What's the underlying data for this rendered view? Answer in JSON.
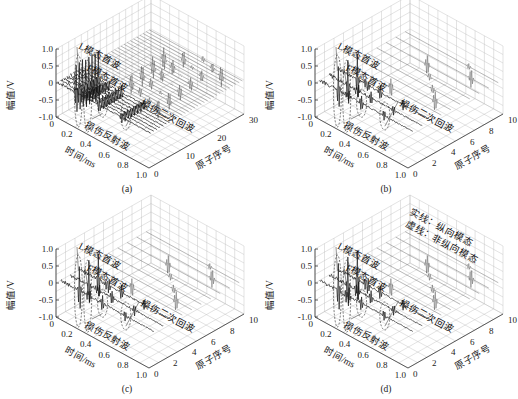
{
  "figure": {
    "panels": [
      {
        "id": "a",
        "caption": "(a)",
        "n_elements": 30,
        "element_ticks": [
          "0",
          "10",
          "20",
          "30"
        ],
        "annotations": [
          "L模态首波",
          "F模态首波",
          "损伤反射波",
          "损伤二次回波"
        ],
        "legend": []
      },
      {
        "id": "b",
        "caption": "(b)",
        "n_elements": 10,
        "element_ticks": [
          "0",
          "2",
          "4",
          "6",
          "8",
          "10"
        ],
        "annotations": [
          "L模态首波",
          "F模态首波",
          "损伤反射波",
          "损伤二次回波"
        ],
        "legend": []
      },
      {
        "id": "c",
        "caption": "(c)",
        "n_elements": 10,
        "element_ticks": [
          "0",
          "2",
          "4",
          "6",
          "8",
          "10"
        ],
        "annotations": [
          "L模态首波",
          "F模态首波",
          "损伤反射波",
          "损伤二次回波"
        ],
        "legend": []
      },
      {
        "id": "d",
        "caption": "(d)",
        "n_elements": 10,
        "element_ticks": [
          "0",
          "2",
          "4",
          "6",
          "8",
          "10"
        ],
        "annotations": [
          "L模态首波",
          "F模态首波",
          "损伤反射波",
          "损伤二次回波"
        ],
        "legend": [
          "实线：纵向模态",
          "虚线：非纵向模态"
        ]
      }
    ]
  },
  "chart_data": [
    {
      "type": "line",
      "subtype": "3d-waterfall",
      "title": "(a)",
      "xlabel": "时间/ms",
      "ylabel": "原子序号",
      "zlabel": "幅值/V",
      "x_ticks": [
        "0",
        "0.2",
        "0.4",
        "0.6",
        "0.8",
        "1.0"
      ],
      "y_ticks": [
        "0",
        "10",
        "20",
        "30"
      ],
      "z_ticks": [
        "-1.0",
        "-0.5",
        "0",
        "0.5",
        "1.0"
      ],
      "xlim": [
        0,
        1.0
      ],
      "ylim": [
        0,
        30
      ],
      "zlim": [
        -1.0,
        1.0
      ],
      "grid": true,
      "annotations": [
        "L模态首波",
        "F模态首波",
        "损伤反射波",
        "损伤二次回波"
      ],
      "series_peaks": [
        {
          "name": "L模态首波",
          "time_ms": 0.2,
          "amplitude": 0.9
        },
        {
          "name": "F模态首波",
          "time_ms": 0.3,
          "amplitude": 0.5
        },
        {
          "name": "损伤反射波",
          "time_ms": 0.45,
          "amplitude": 0.3
        },
        {
          "name": "损伤二次回波",
          "time_ms": 0.7,
          "amplitude": 0.3
        }
      ]
    },
    {
      "type": "line",
      "subtype": "3d-waterfall",
      "title": "(b)",
      "xlabel": "时间/ms",
      "ylabel": "原子序号",
      "zlabel": "幅值/V",
      "x_ticks": [
        "0",
        "0.2",
        "0.4",
        "0.6",
        "0.8",
        "1.0"
      ],
      "y_ticks": [
        "0",
        "2",
        "4",
        "6",
        "8",
        "10"
      ],
      "z_ticks": [
        "-1.0",
        "-0.5",
        "0",
        "0.5",
        "1.0"
      ],
      "xlim": [
        0,
        1.0
      ],
      "ylim": [
        0,
        10
      ],
      "zlim": [
        -1.0,
        1.0
      ],
      "grid": true,
      "annotations": [
        "L模态首波",
        "F模态首波",
        "损伤反射波",
        "损伤二次回波"
      ],
      "series_peaks": [
        {
          "name": "L模态首波",
          "time_ms": 0.2,
          "amplitude": 0.8
        },
        {
          "name": "F模态首波",
          "time_ms": 0.3,
          "amplitude": 0.5
        },
        {
          "name": "损伤反射波",
          "time_ms": 0.45,
          "amplitude": 0.3
        },
        {
          "name": "损伤二次回波",
          "time_ms": 0.7,
          "amplitude": 0.3
        }
      ]
    },
    {
      "type": "line",
      "subtype": "3d-waterfall",
      "title": "(c)",
      "xlabel": "时间/ms",
      "ylabel": "原子序号",
      "zlabel": "幅值/V",
      "x_ticks": [
        "0",
        "0.2",
        "0.4",
        "0.6",
        "0.8",
        "1.0"
      ],
      "y_ticks": [
        "0",
        "2",
        "4",
        "6",
        "8",
        "10"
      ],
      "z_ticks": [
        "-1.0",
        "-0.5",
        "0",
        "0.5",
        "1.0"
      ],
      "xlim": [
        0,
        1.0
      ],
      "ylim": [
        0,
        10
      ],
      "zlim": [
        -1.0,
        1.0
      ],
      "grid": true,
      "annotations": [
        "L模态首波",
        "F模态首波",
        "损伤反射波",
        "损伤二次回波"
      ],
      "series_peaks": [
        {
          "name": "L模态首波",
          "time_ms": 0.2,
          "amplitude": 0.8
        },
        {
          "name": "F模态首波",
          "time_ms": 0.3,
          "amplitude": 0.6
        },
        {
          "name": "损伤反射波",
          "time_ms": 0.45,
          "amplitude": 0.3
        },
        {
          "name": "损伤二次回波",
          "time_ms": 0.7,
          "amplitude": 0.3
        }
      ]
    },
    {
      "type": "line",
      "subtype": "3d-waterfall",
      "title": "(d)",
      "xlabel": "时间/ms",
      "ylabel": "原子序号",
      "zlabel": "幅值/V",
      "x_ticks": [
        "0",
        "0.2",
        "0.4",
        "0.6",
        "0.8",
        "1.0"
      ],
      "y_ticks": [
        "0",
        "2",
        "4",
        "6",
        "8",
        "10"
      ],
      "z_ticks": [
        "-1.0",
        "-0.5",
        "0",
        "0.5",
        "1.0"
      ],
      "xlim": [
        0,
        1.0
      ],
      "ylim": [
        0,
        10
      ],
      "zlim": [
        -1.0,
        1.0
      ],
      "grid": true,
      "legend": [
        "实线：纵向模态",
        "虚线：非纵向模态"
      ],
      "annotations": [
        "L模态首波",
        "F模态首波",
        "损伤反射波",
        "损伤二次回波"
      ],
      "series_peaks": [
        {
          "name": "L模态首波",
          "time_ms": 0.2,
          "amplitude": 0.9
        },
        {
          "name": "F模态首波",
          "time_ms": 0.3,
          "amplitude": 0.8
        },
        {
          "name": "损伤反射波",
          "time_ms": 0.45,
          "amplitude": 0.3
        },
        {
          "name": "损伤二次回波",
          "time_ms": 0.7,
          "amplitude": 0.3
        }
      ]
    }
  ],
  "labels": {
    "zlabel": "幅值/V",
    "xlabel": "时间/ms",
    "ylabel": "原子序号",
    "z_ticks": [
      "1.0",
      "0.5",
      "0",
      "-0.5",
      "-1.0"
    ],
    "x_ticks": [
      "0",
      "0.2",
      "0.4",
      "0.6",
      "0.8",
      "1.0"
    ]
  }
}
